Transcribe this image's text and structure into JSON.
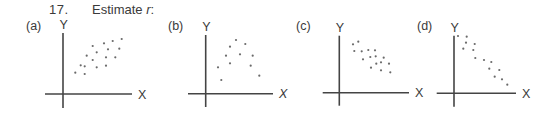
{
  "header": {
    "number": "17.",
    "prompt": "Estimate",
    "variable": "r",
    "suffix": ":"
  },
  "chart_data": [
    {
      "type": "scatter",
      "label": "(a)",
      "xlabel": "X",
      "ylabel": "Y",
      "description": "moderate positive linear association",
      "axes": {
        "origin": [
          63,
          94
        ],
        "x_end": 132,
        "x_start": 45,
        "y_top": 33,
        "y_bottom": 108
      },
      "points": [
        [
          75.3,
          72.7
        ],
        [
          84.7,
          74
        ],
        [
          80.7,
          65.3
        ],
        [
          84.7,
          66.3
        ],
        [
          96.7,
          67.3
        ],
        [
          106,
          65.7
        ],
        [
          86.7,
          55.7
        ],
        [
          92.7,
          60
        ],
        [
          92.7,
          46
        ],
        [
          96.7,
          52.3
        ],
        [
          106,
          57.3
        ],
        [
          115.3,
          57.3
        ],
        [
          104,
          43.3
        ],
        [
          108,
          49.3
        ],
        [
          112.7,
          41
        ],
        [
          119.3,
          48.7
        ],
        [
          121.7,
          39
        ]
      ]
    },
    {
      "type": "scatter",
      "label": "(b)",
      "xlabel": "X",
      "ylabel": "Y",
      "description": "curved (inverted U) pattern, r near 0",
      "axes": {
        "origin": [
          205.7,
          93.7
        ],
        "x_end": 273,
        "x_start": 188,
        "y_top": 35,
        "y_bottom": 107
      },
      "points": [
        [
          236,
          40
        ],
        [
          230,
          46.7
        ],
        [
          245.3,
          44
        ],
        [
          226,
          55.7
        ],
        [
          240,
          54.3
        ],
        [
          252.7,
          55.7
        ],
        [
          230,
          63.3
        ],
        [
          218,
          67.3
        ],
        [
          250.7,
          65.7
        ],
        [
          221.3,
          80
        ],
        [
          259.3,
          75.7
        ]
      ]
    },
    {
      "type": "scatter",
      "label": "(c)",
      "xlabel": "X",
      "ylabel": "Y",
      "description": "moderate negative linear association",
      "axes": {
        "origin": [
          339.3,
          92.7
        ],
        "x_end": 409,
        "x_start": 322.7,
        "y_top": 35.7,
        "y_bottom": 105.7
      },
      "points": [
        [
          353,
          44.3
        ],
        [
          358.3,
          41.7
        ],
        [
          354.3,
          51
        ],
        [
          361.7,
          51.3
        ],
        [
          368.3,
          50
        ],
        [
          375,
          50.3
        ],
        [
          363,
          59.3
        ],
        [
          370.3,
          57
        ],
        [
          375.7,
          56.3
        ],
        [
          383.7,
          57.7
        ],
        [
          376.3,
          63.7
        ],
        [
          381,
          62.3
        ],
        [
          389,
          63.7
        ],
        [
          371,
          67.7
        ],
        [
          381,
          70.3
        ],
        [
          390.3,
          72.3
        ]
      ]
    },
    {
      "type": "scatter",
      "label": "(d)",
      "xlabel": "X",
      "ylabel": "Y",
      "description": "strong negative linear association",
      "axes": {
        "origin": [
          454,
          93.3
        ],
        "x_end": 516,
        "x_start": 436.7,
        "y_top": 35.7,
        "y_bottom": 106.7
      },
      "points": [
        [
          458,
          36
        ],
        [
          466.7,
          36.7
        ],
        [
          466,
          42.7
        ],
        [
          474.7,
          44
        ],
        [
          463.3,
          48.7
        ],
        [
          473.3,
          50
        ],
        [
          475.3,
          58
        ],
        [
          484,
          60
        ],
        [
          491.3,
          62
        ],
        [
          489.3,
          68.7
        ],
        [
          499.3,
          70
        ],
        [
          494.7,
          76.7
        ],
        [
          502,
          79.3
        ],
        [
          507.3,
          84.7
        ]
      ]
    }
  ]
}
